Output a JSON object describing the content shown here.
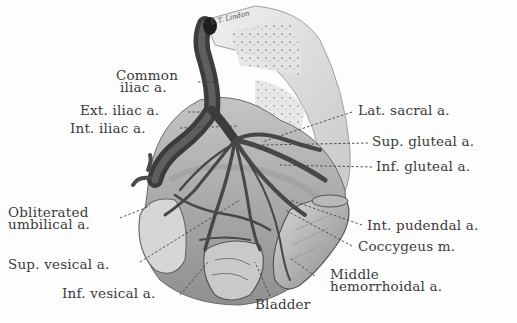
{
  "figure": {
    "signature": "E.T. Lindon",
    "style": "grayscale anatomical illustration"
  },
  "labels": {
    "common_iliac": [
      "Common",
      "iliac a."
    ],
    "ext_iliac": "Ext. iliac a.",
    "int_iliac": "Int. iliac a.",
    "lat_sacral": "Lat. sacral a.",
    "sup_gluteal": "Sup. gluteal a.",
    "inf_gluteal": "Inf. gluteal a.",
    "obliterated_umbilical": [
      "Obliterated",
      "umbilical a."
    ],
    "int_pudendal": "Int. pudendal a.",
    "coccygeus": "Coccygeus m.",
    "sup_vesical": "Sup. vesical a.",
    "inf_vesical": "Inf. vesical a.",
    "middle_hemorrhoidal": [
      "Middle",
      "hemorrhoidal a."
    ],
    "bladder": "Bladder"
  },
  "colors": {
    "artery_dark": "#3c3c3c",
    "artery_mid": "#6e6e6e",
    "tissue_light": "#cfcfcf",
    "bone": "#e6e6e6",
    "label_text": "#3a3a3a",
    "leader_line": "#444444"
  }
}
